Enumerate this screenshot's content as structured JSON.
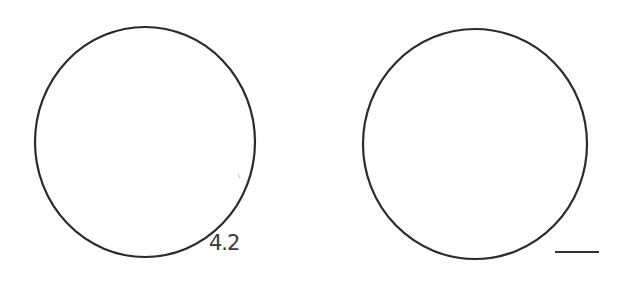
{
  "figure": {
    "circles": [
      {
        "id": "left-circle",
        "cx": 145,
        "cy": 142,
        "r": 110,
        "label": "4.2"
      },
      {
        "id": "right-circle",
        "cx": 475,
        "cy": 144,
        "r": 112,
        "label": ""
      }
    ],
    "left_label": "4.2",
    "right_answer_blank": "",
    "stroke_color": "#2b2b2b",
    "background": "#ffffff"
  }
}
